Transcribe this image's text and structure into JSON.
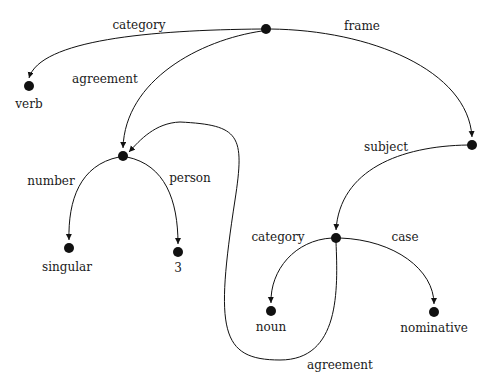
{
  "diagram": {
    "title": "",
    "nodes": [
      {
        "id": "root",
        "x": 266,
        "y": 29,
        "label": ""
      },
      {
        "id": "verb",
        "x": 29,
        "y": 86,
        "label": "verb",
        "lx": 29,
        "ly": 104
      },
      {
        "id": "agr",
        "x": 123,
        "y": 156,
        "label": ""
      },
      {
        "id": "frame",
        "x": 472,
        "y": 145,
        "label": ""
      },
      {
        "id": "sing",
        "x": 69,
        "y": 248,
        "label": "singular",
        "lx": 67,
        "ly": 267
      },
      {
        "id": "three",
        "x": 178,
        "y": 252,
        "label": "3",
        "lx": 178,
        "ly": 268
      },
      {
        "id": "subj",
        "x": 336,
        "y": 238,
        "label": ""
      },
      {
        "id": "noun",
        "x": 271,
        "y": 311,
        "label": "noun",
        "lx": 271,
        "ly": 327
      },
      {
        "id": "nom",
        "x": 434,
        "y": 312,
        "label": "nominative",
        "lx": 434,
        "ly": 328
      }
    ],
    "edges": [
      {
        "label": "category",
        "lx": 139,
        "ly": 25,
        "d": "M262,29 C150,30 40,40 29,78"
      },
      {
        "label": "agreement",
        "lx": 105,
        "ly": 79,
        "d": "M262,31 C200,40 125,80 123,148"
      },
      {
        "label": "frame",
        "lx": 362,
        "ly": 26,
        "d": "M270,29 C370,30 468,70 472,137"
      },
      {
        "label": "number",
        "lx": 51,
        "ly": 181,
        "d": "M119,157 C80,165 68,200 69,240"
      },
      {
        "label": "person",
        "lx": 190,
        "ly": 178,
        "d": "M127,157 C165,165 178,200 178,244"
      },
      {
        "label": "subject",
        "lx": 386,
        "ly": 147,
        "d": "M468,145 C400,146 340,170 336,230"
      },
      {
        "label": "category",
        "lx": 278,
        "ly": 237,
        "d": "M332,238 C295,240 270,270 271,303"
      },
      {
        "label": "case",
        "lx": 405,
        "ly": 237,
        "d": "M340,238 C395,240 434,270 434,304"
      },
      {
        "label": "agreement",
        "lx": 340,
        "ly": 365,
        "d": "M336,242 C338,290 340,360 280,360 C220,360 215,330 235,200 C245,135 240,125 180,122 C155,123 140,140 129,152"
      }
    ]
  }
}
